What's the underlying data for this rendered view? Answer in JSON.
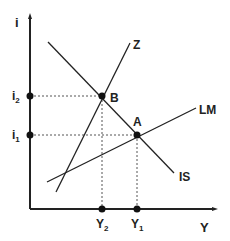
{
  "figure": {
    "type": "IS-LM diagram",
    "axes": {
      "y_label": "i",
      "x_label": "Y",
      "origin": [
        30,
        209
      ],
      "y_top": 15,
      "x_right": 216
    },
    "curves": [
      {
        "name": "IS",
        "label": "IS",
        "from": [
          48,
          42
        ],
        "to": [
          174,
          173
        ],
        "label_pos": [
          179,
          178
        ]
      },
      {
        "name": "LM",
        "label": "LM",
        "from": [
          47,
          182
        ],
        "to": [
          196,
          108
        ],
        "label_pos": [
          199,
          114
        ]
      },
      {
        "name": "Z",
        "label": "Z",
        "from": [
          56,
          192
        ],
        "to": [
          130,
          43
        ],
        "label_pos": [
          132,
          49
        ]
      }
    ],
    "points": [
      {
        "name": "B",
        "label": "B",
        "pos": [
          102,
          96
        ],
        "label_pos": [
          110,
          103
        ]
      },
      {
        "name": "A",
        "label": "A",
        "pos": [
          137,
          135
        ],
        "label_pos": [
          133,
          126
        ]
      }
    ],
    "y_ticks": [
      {
        "label": "i",
        "sub": "2",
        "y": 96
      },
      {
        "label": "i",
        "sub": "1",
        "y": 135
      }
    ],
    "x_ticks": [
      {
        "label": "Y",
        "sub": "2",
        "x": 102
      },
      {
        "label": "Y",
        "sub": "1",
        "x": 137
      }
    ],
    "colors": {
      "line": "#222222",
      "dashed": "#555555",
      "background": "#ffffff"
    }
  }
}
